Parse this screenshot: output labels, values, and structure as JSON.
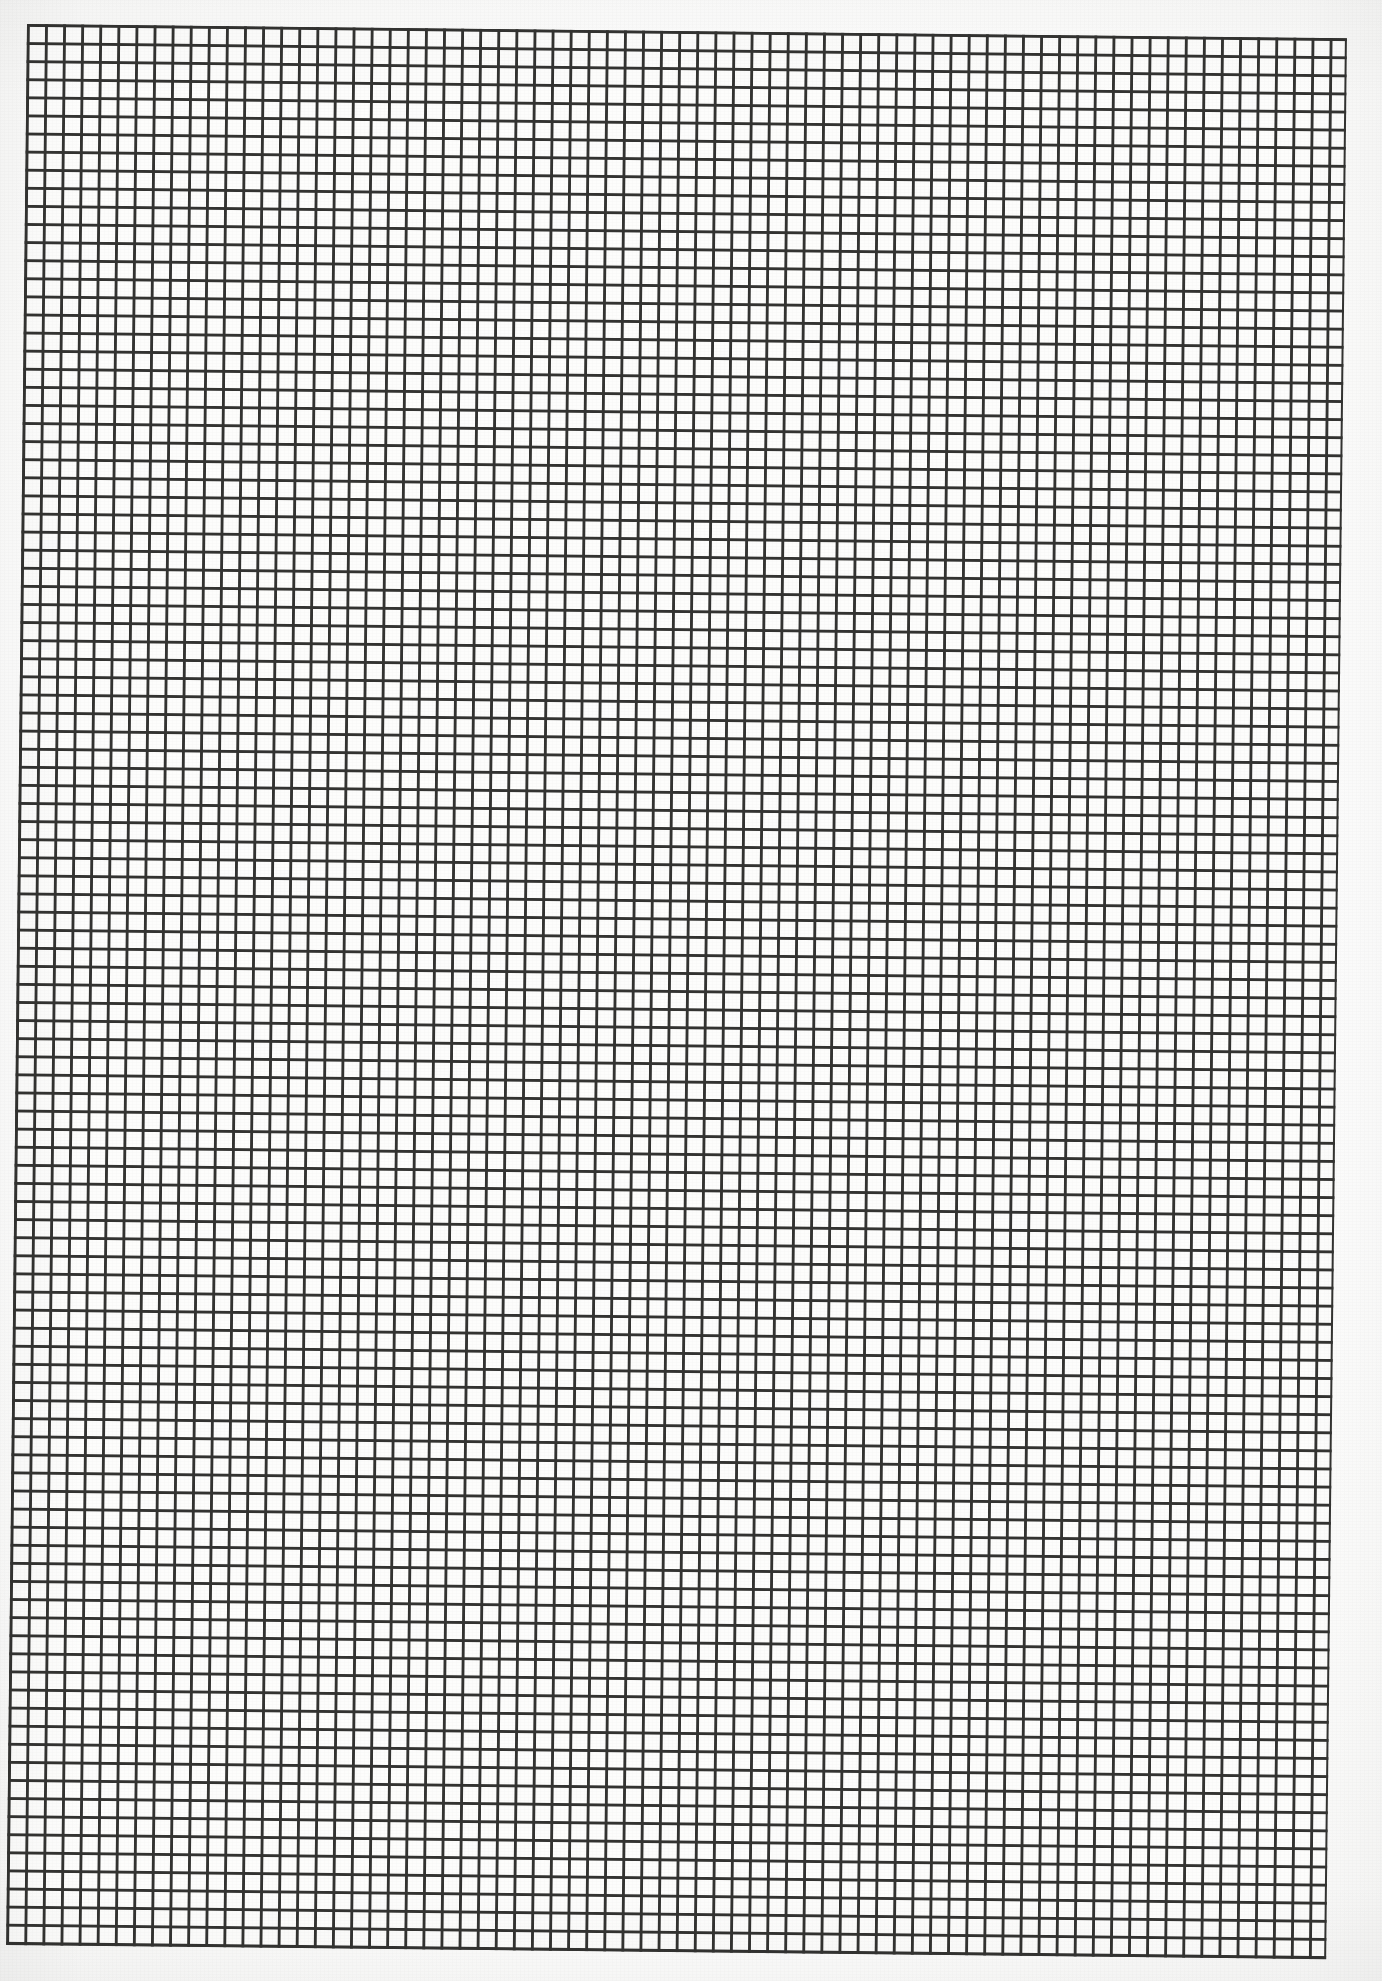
{
  "document": {
    "kind": "graph-paper-scan",
    "title": "Square Grid Graph Paper",
    "caption": "",
    "page_width_px": 1382,
    "page_height_px": 1981,
    "page_background": "#ffffff",
    "paper_tone": "#fdfdfc"
  },
  "grid": {
    "style": "uniform-square",
    "columns": 73,
    "rows": 106,
    "cell_size_px": 18.1,
    "line_color": "#333331",
    "line_width_px": 2.4,
    "border_color": "#333331",
    "border_width_px": 2.4,
    "has_major_lines": false,
    "major_line_every": 0,
    "origin_x_px": 27,
    "origin_y_px": 24,
    "sheet_width_px": 1320,
    "sheet_height_px": 1921,
    "skew_degrees": 0.62
  },
  "chart_data": {
    "type": "table",
    "xlabel": "",
    "ylabel": "",
    "columns": 73,
    "rows": 106,
    "cell_size_px": 18.1,
    "grid": "on",
    "legend": "none",
    "annotations": [],
    "tick_labels_x": [],
    "tick_labels_y": [],
    "values": []
  },
  "annotations": {
    "marks": [],
    "notes": ""
  }
}
